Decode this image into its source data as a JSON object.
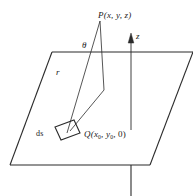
{
  "figure": {
    "stroke_color": "#2b2b2b",
    "background_color": "#ffffff",
    "labels": {
      "point_p": "P(x, y, z)",
      "axis_z": "z",
      "angle_theta": "θ",
      "distance_r": "r",
      "surface_element": "ds",
      "point_q_prefix": "Q(x",
      "point_q_sub1": "0",
      "point_q_mid": ", y",
      "point_q_sub2": "0",
      "point_q_suffix": ", 0)"
    },
    "geometry": {
      "plane_polygon": "52,52 193,52 150,165 10,165",
      "plane_top_edge": "52,52 193,52",
      "plane_left_edge": "52,52 10,165",
      "plane_bottom_edge": "10,165 150,165",
      "plane_right_edge": "193,52 150,165",
      "point_p": [
        100,
        20
      ],
      "point_q": [
        70,
        130
      ],
      "ds_square": "55,126 74,120 80,133 61,140",
      "vertical_from_p": "100,20 104,90",
      "leg_to_q": "104,90 70,130",
      "line_r": "100,20 68,132",
      "z_axis_line": "131,130 131,40",
      "z_axis_arrow": "131,36 128,44 134,44",
      "below_plane_line": "131,165 131,196"
    }
  }
}
